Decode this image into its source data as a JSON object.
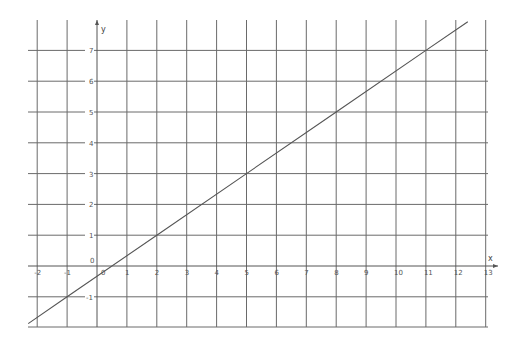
{
  "chart_data": {
    "type": "line",
    "title": "",
    "xlabel": "x",
    "ylabel": "y",
    "xlim": [
      -2.3,
      13.4
    ],
    "ylim": [
      -1.9,
      7.9
    ],
    "grid": true,
    "x_ticks": [
      -2,
      -1,
      0,
      1,
      2,
      3,
      4,
      5,
      6,
      7,
      8,
      9,
      10,
      11,
      12,
      13
    ],
    "y_ticks": [
      -1,
      0,
      1,
      2,
      3,
      4,
      5,
      6,
      7
    ],
    "series": [
      {
        "name": "y = (2/3)x - 1/3",
        "x": [
          -2.3,
          -1,
          2,
          5,
          8,
          11,
          12.4
        ],
        "y": [
          -1.87,
          -1,
          1,
          3,
          5,
          7,
          7.93
        ]
      }
    ]
  },
  "layout": {
    "origin_px": [
      97,
      266
    ],
    "x_step_px": 29.9,
    "y_step_px": 30.8,
    "grid_left_px": 28,
    "grid_right_px": 498,
    "grid_top_px": 20,
    "grid_bottom_px": 327
  }
}
